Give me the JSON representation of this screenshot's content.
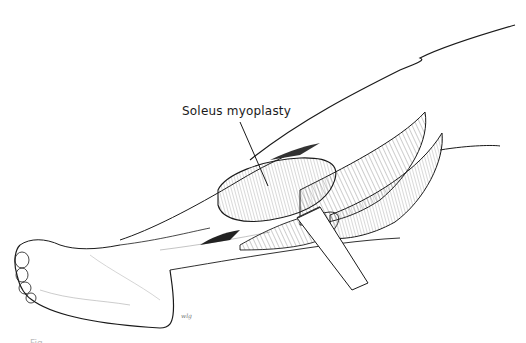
{
  "figure": {
    "label": "Soleus myoplasty",
    "signature": "wlg",
    "caption": "Fig."
  },
  "colors": {
    "ink": "#1a1a1a",
    "background": "#ffffff",
    "hatch": "#555555"
  }
}
